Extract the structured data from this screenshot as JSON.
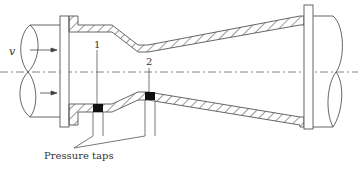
{
  "diagram": {
    "labels": {
      "velocity": "v",
      "tap1": "1",
      "tap2": "2",
      "pressure_taps": "Pressure taps"
    },
    "colors": {
      "line": "#555555",
      "hatch": "#444444",
      "tap_block": "#111111",
      "centerline": "#666666",
      "background": "#ffffff"
    }
  }
}
